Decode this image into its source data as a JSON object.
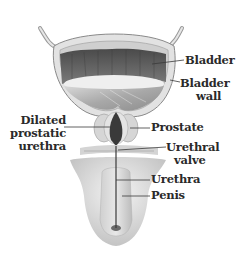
{
  "diagram": {
    "type": "anatomical-illustration",
    "colors": {
      "background": "#ffffff",
      "label_text": "#2a2a2a",
      "leader_line": "#3a3a3a",
      "bladder_interior_dark": "#5a5a5a",
      "tissue_light": "#e6e6e6",
      "tissue_mid": "#bdbdbd"
    },
    "labels": {
      "bladder": "Bladder",
      "bladder_wall_line1": "Bladder",
      "bladder_wall_line2": "wall",
      "dilated_line1": "Dilated",
      "dilated_line2": "prostatic",
      "dilated_line3": "urethra",
      "prostate": "Prostate",
      "urethral_valve_line1": "Urethral",
      "urethral_valve_line2": "valve",
      "urethra": "Urethra",
      "penis": "Penis"
    }
  }
}
